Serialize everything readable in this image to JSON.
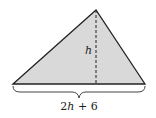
{
  "diagram": {
    "shape": "triangle",
    "fill_color": "#d9d9d9",
    "stroke_color": "#222222",
    "height_label": "h",
    "base_label": "2h + 6",
    "base_label_parts": {
      "coef": "2",
      "var": "h",
      "rest": " + 6"
    }
  }
}
